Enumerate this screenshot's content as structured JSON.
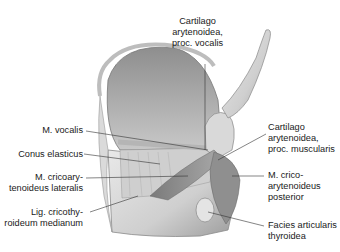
{
  "figure": {
    "labels": {
      "top": "Cartilago\narytenoidea,\nproc. vocalis",
      "left": [
        "M. vocalis",
        "Conus elasticus",
        "M. cricoary-\ntenoideus lateralis",
        "Lig. cricothy-\nroideum medianum"
      ],
      "right": [
        "Cartilago\narytenoidea,\nproc. muscularis",
        "M. crico-\narytenoideus\nposterior",
        "Facies articularis\nthyroidea"
      ]
    }
  }
}
